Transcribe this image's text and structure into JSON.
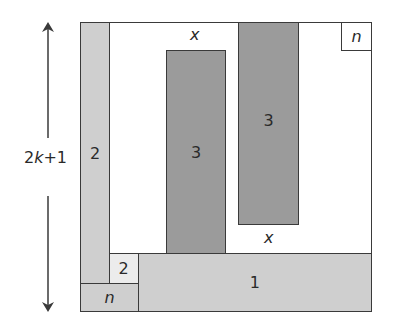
{
  "diagram": {
    "dimension_label": {
      "prefix": "2",
      "variable": "k",
      "suffix": "+1"
    },
    "regions": {
      "left_strip": "2",
      "small_square": "2",
      "bottom_left": "n",
      "bottom_bar": "1",
      "left_tall_bar": "3",
      "right_tall_bar": "3",
      "top_right_square": "n"
    },
    "gap_labels": {
      "top_gap": "x",
      "bottom_gap": "x"
    },
    "colors": {
      "light_gray": "#cfcfcf",
      "dark_gray": "#9b9b9b",
      "pale": "#ececec",
      "border": "#3a3a3a",
      "background": "#ffffff"
    }
  }
}
